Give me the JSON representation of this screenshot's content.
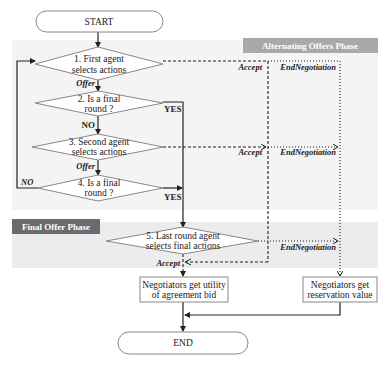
{
  "diagram": {
    "type": "flowchart",
    "title": "",
    "phases": {
      "alternating": {
        "label": "Alternating Offers Phase",
        "label_bg": "#a9a9a9",
        "region_bg": "#f4f4f4"
      },
      "final": {
        "label": "Final Offer Phase",
        "label_bg": "#6b6b6b",
        "region_bg": "#ececec"
      }
    },
    "nodes": {
      "start": {
        "label": "START",
        "shape": "terminal"
      },
      "d1": {
        "line1": "1. First agent",
        "line2": "selects actions",
        "shape": "diamond"
      },
      "d2": {
        "line1": "2. Is a final",
        "line2": "round ?",
        "shape": "diamond"
      },
      "d3": {
        "line1": "3. Second agent",
        "line2": "selects actions",
        "shape": "diamond"
      },
      "d4": {
        "line1": "4. Is a final",
        "line2": "round ?",
        "shape": "diamond"
      },
      "d5": {
        "line1": "5. Last round agent",
        "line2": "selects final actions",
        "shape": "diamond"
      },
      "utility": {
        "line1": "Negotiators get utility",
        "line2": "of agreement bid",
        "shape": "box"
      },
      "reservation": {
        "line1": "Negotiators get",
        "line2": "reservation value",
        "shape": "box"
      },
      "end": {
        "label": "END",
        "shape": "terminal"
      }
    },
    "edge_labels": {
      "offer1": "Offer",
      "offer2": "Offer",
      "yes1": "YES",
      "no1": "NO",
      "yes2": "YES",
      "no2": "NO",
      "accept1": "Accept",
      "accept2": "Accept",
      "accept3": "Accept",
      "endneg1": "EndNegotiation",
      "endneg2": "EndNegotiation",
      "endneg3": "EndNegotiation"
    },
    "edges": [
      {
        "from": "start",
        "to": "d1",
        "style": "solid"
      },
      {
        "from": "d1",
        "to": "d2",
        "label": "Offer",
        "style": "solid"
      },
      {
        "from": "d2",
        "to": "d3",
        "label": "NO",
        "style": "solid"
      },
      {
        "from": "d2",
        "to": "d5",
        "label": "YES",
        "style": "solid"
      },
      {
        "from": "d3",
        "to": "d4",
        "label": "Offer",
        "style": "solid"
      },
      {
        "from": "d4",
        "to": "d1",
        "label": "NO",
        "style": "solid"
      },
      {
        "from": "d4",
        "to": "d5",
        "label": "YES",
        "style": "solid"
      },
      {
        "from": "d1",
        "to": "utility",
        "label": "Accept",
        "style": "dashed"
      },
      {
        "from": "d3",
        "to": "utility",
        "label": "Accept",
        "style": "dashed"
      },
      {
        "from": "d5",
        "to": "utility",
        "label": "Accept",
        "style": "dashed"
      },
      {
        "from": "d1",
        "to": "reservation",
        "label": "EndNegotiation",
        "style": "dotted"
      },
      {
        "from": "d3",
        "to": "reservation",
        "label": "EndNegotiation",
        "style": "dotted"
      },
      {
        "from": "d5",
        "to": "reservation",
        "label": "EndNegotiation",
        "style": "dotted"
      },
      {
        "from": "utility",
        "to": "end",
        "style": "solid"
      },
      {
        "from": "reservation",
        "to": "end",
        "style": "solid"
      }
    ],
    "colors": {
      "line": "#222222",
      "node_border": "#888888",
      "node_fill": "#ffffff"
    }
  }
}
